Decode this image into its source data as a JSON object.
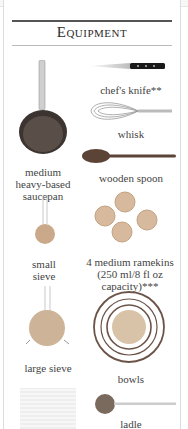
{
  "title": "Equipment",
  "items": [
    {
      "label": "chef's knife**",
      "icon": "knife-icon"
    },
    {
      "label": "medium heavy-based saucepan",
      "lines": [
        "medium",
        "heavy-based",
        "saucepan"
      ],
      "icon": "saucepan-icon"
    },
    {
      "label": "whisk",
      "icon": "whisk-icon"
    },
    {
      "label": "wooden spoon",
      "icon": "wooden-spoon-icon"
    },
    {
      "label": "small sieve",
      "lines": [
        "small",
        "sieve"
      ],
      "icon": "small-sieve-icon"
    },
    {
      "label": "4 medium ramekins (250 ml/8 fl oz capacity)***",
      "lines": [
        "4 medium ramekins",
        "(250 ml/8 fl oz",
        "capacity)***"
      ],
      "icon": "ramekins-icon"
    },
    {
      "label": "large sieve",
      "icon": "large-sieve-icon"
    },
    {
      "label": "bowls",
      "icon": "bowls-icon"
    },
    {
      "label": "",
      "icon": "muslin-cloth-icon"
    },
    {
      "label": "ladle",
      "icon": "ladle-icon"
    }
  ]
}
